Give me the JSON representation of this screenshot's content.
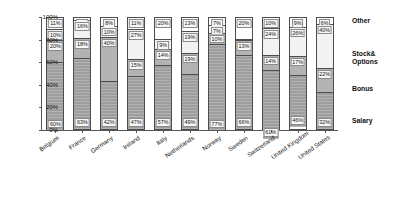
{
  "chart_data": {
    "type": "bar",
    "subtype": "stacked-percentage-column",
    "title": "",
    "xlabel": "",
    "ylabel": "",
    "ylim": [
      0,
      100
    ],
    "yticks": [
      "0%",
      "20%",
      "40%",
      "60%",
      "80%",
      "100%"
    ],
    "ytick_values": [
      0,
      20,
      40,
      60,
      80,
      100
    ],
    "grid": false,
    "legend_position": "right",
    "categories": [
      "Belgium",
      "France",
      "Germany",
      "Ireland",
      "Italy",
      "Netherlands",
      "Norway",
      "Sweden",
      "Switzerland",
      "United Kingdom",
      "United States"
    ],
    "series": [
      {
        "name": "Salary",
        "color": "#9e9e9e",
        "values": [
          60,
          63,
          42,
          47,
          57,
          49,
          77,
          66,
          61,
          46,
          32
        ],
        "labels": [
          "60%",
          "63%",
          "42%",
          "47%",
          "57%",
          "49%",
          "77%",
          "66%",
          "61%",
          "46%",
          "32%"
        ]
      },
      {
        "name": "Bonus",
        "color": "#b3b3b3",
        "values": [
          20,
          18,
          40,
          15,
          14,
          19,
          10,
          13,
          14,
          17,
          22
        ],
        "labels": [
          "20%",
          "18%",
          "40%",
          "15%",
          "14%",
          "19%",
          "10%",
          "13%",
          "14%",
          "17%",
          "22%"
        ]
      },
      {
        "name": "Stock&\nOptions",
        "color": "#f2f2f2",
        "values": [
          10,
          16,
          10,
          27,
          9,
          19,
          7,
          1,
          24,
          26,
          40
        ],
        "labels": [
          "10%",
          "16%",
          "10%",
          "27%",
          "9%",
          "19%",
          "7%",
          "",
          "24%",
          "26%",
          "40%"
        ]
      },
      {
        "name": "Other",
        "color": "#ffffff",
        "values": [
          11,
          3,
          8,
          11,
          20,
          13,
          7,
          20,
          10,
          9,
          6
        ],
        "labels": [
          "11%",
          "3%",
          "8%",
          "11%",
          "20%",
          "13%",
          "7%",
          "20%",
          "10%",
          "9%",
          "6%"
        ]
      }
    ],
    "legend": [
      {
        "label": "Other",
        "color": "#ffffff"
      },
      {
        "label": "Stock&\nOptions",
        "color": "#f2f2f2"
      },
      {
        "label": "Bonus",
        "color": "#b3b3b3"
      },
      {
        "label": "Salary",
        "color": "#9e9e9e"
      }
    ]
  }
}
